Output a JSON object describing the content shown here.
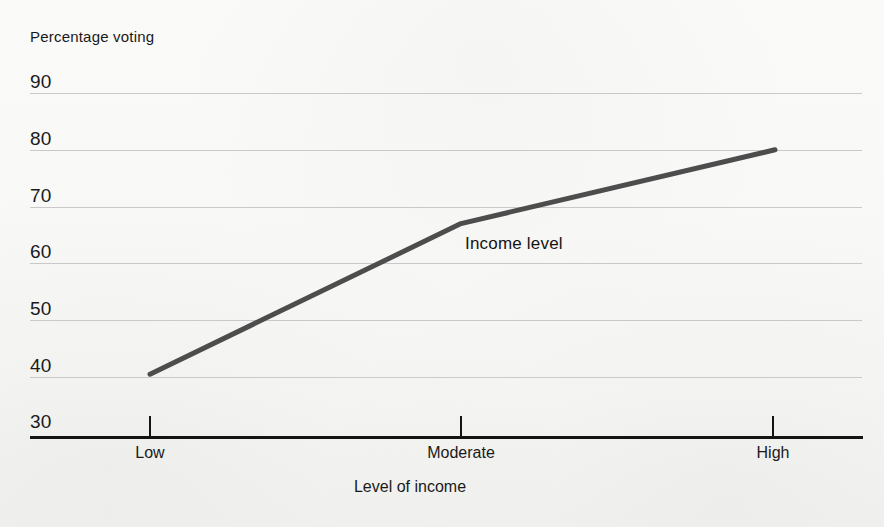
{
  "chart_data": {
    "type": "line",
    "title": "",
    "ylabel": "Percentage voting",
    "xlabel": "Level of income",
    "categories": [
      "Low",
      "Moderate",
      "High"
    ],
    "series": [
      {
        "name": "Income level",
        "values": [
          40.5,
          67,
          80
        ]
      }
    ],
    "ylim": [
      30,
      90
    ],
    "yticks": [
      90,
      80,
      70,
      60,
      50,
      40,
      30
    ],
    "ytick_labels": [
      "90",
      "80",
      "70",
      "60",
      "50",
      "40",
      "30"
    ],
    "grid": true,
    "legend": "none",
    "annotations": [
      {
        "text": "Income level",
        "x": "Moderate",
        "y": 63
      }
    ],
    "line_color": "#4d4d4d",
    "grid_color": "#c9c9c9",
    "axis_color": "#141414",
    "background_color": "#fbfbfa"
  },
  "axes": {
    "y_axis_title": "Percentage voting",
    "x_axis_title": "Level of income",
    "y_ticks": [
      {
        "label": "90",
        "value": 90
      },
      {
        "label": "80",
        "value": 80
      },
      {
        "label": "70",
        "value": 70
      },
      {
        "label": "60",
        "value": 60
      },
      {
        "label": "50",
        "value": 50
      },
      {
        "label": "40",
        "value": 40
      },
      {
        "label": "30",
        "value": 30
      }
    ],
    "x_ticks": [
      {
        "label": "Low",
        "value": 0
      },
      {
        "label": "Moderate",
        "value": 1
      },
      {
        "label": "High",
        "value": 2
      }
    ]
  },
  "series_label": "Income level"
}
